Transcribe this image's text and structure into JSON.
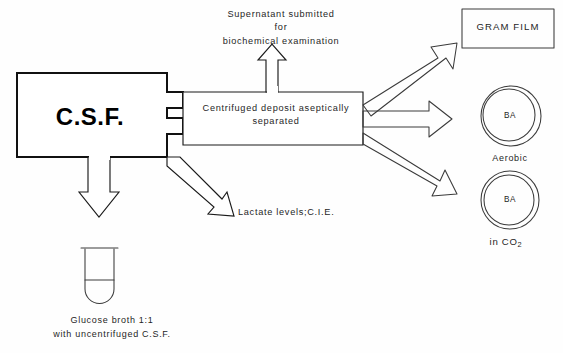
{
  "diagram": {
    "background_color": "#fefefe",
    "ink_color": "#1b1b1b"
  },
  "source": {
    "label": "C.S.F."
  },
  "branches": {
    "supernatant": {
      "line1": "Supernatant  submitted",
      "line2": "for",
      "line3": "biochemical  examination"
    },
    "deposit": {
      "line1": "Centrifuged  deposit  aseptically",
      "line2": "separated"
    },
    "lactate": {
      "label": "Lactate levels;C.I.E."
    }
  },
  "outputs": {
    "gram_film": {
      "label": "GRAM FILM"
    },
    "plate_aerobic": {
      "medium": "BA",
      "condition": "Aerobic"
    },
    "plate_co2": {
      "medium": "BA",
      "condition_prefix": "in CO",
      "condition_subscript": "2"
    },
    "broth": {
      "line1": "Glucose broth 1:1",
      "line2": "with uncentrifuged C.S.F."
    }
  }
}
